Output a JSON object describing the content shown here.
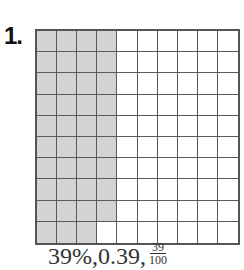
{
  "problem": {
    "number_label": "1.",
    "header_faint_text": "",
    "grid": {
      "rows": 10,
      "cols": 10,
      "shaded_count": 39,
      "shaded_cells_description": "Columns 1-3 fully shaded, column 4 rows 1-9 shaded",
      "shaded_color": "#d3d3d3",
      "unshaded_color": "#ffffff",
      "line_color": "#555555"
    },
    "answer": {
      "percent": "39%",
      "sep1": ", ",
      "decimal": "0.39",
      "sep2": ", ",
      "fraction_numerator": "39",
      "fraction_denominator": "100"
    }
  }
}
